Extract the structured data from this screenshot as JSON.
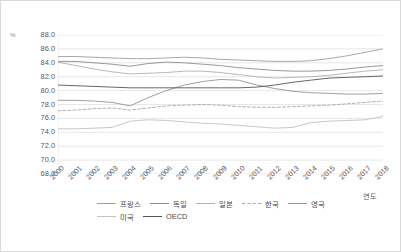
{
  "axes": {
    "y_unit_label": "%",
    "y_ticks": [
      "88.0",
      "86.0",
      "84.0",
      "82.0",
      "80.0",
      "78.0",
      "76.0",
      "74.0",
      "72.0",
      "70.0",
      "68.0"
    ],
    "x_title": "연도",
    "x_ticks": [
      "2000",
      "2001",
      "2002",
      "2003",
      "2004",
      "2005",
      "2006",
      "2007",
      "2008",
      "2009",
      "2010",
      "2011",
      "2012",
      "2013",
      "2014",
      "2015",
      "2016",
      "2017",
      "2018"
    ]
  },
  "legend": {
    "items": [
      {
        "label": "프랑스",
        "color": "#9e9e9e",
        "dash": "solid"
      },
      {
        "label": "독일",
        "color": "#8c8c8c",
        "dash": "solid"
      },
      {
        "label": "일본",
        "color": "#b0b0b0",
        "dash": "solid"
      },
      {
        "label": "한국",
        "color": "#a8a8a8",
        "dash": "dashed"
      },
      {
        "label": "영국",
        "color": "#949494",
        "dash": "solid"
      },
      {
        "label": "미국",
        "color": "#c2c2c2",
        "dash": "solid"
      },
      {
        "label": "OECD",
        "color": "#555555",
        "dash": "solid"
      }
    ]
  },
  "chart_data": {
    "type": "line",
    "title": "",
    "xlabel": "연도",
    "ylabel": "%",
    "ylim": [
      68.0,
      88.0
    ],
    "ytick_step": 2.0,
    "grid": true,
    "legend_position": "bottom",
    "x": [
      2000,
      2001,
      2002,
      2003,
      2004,
      2005,
      2006,
      2007,
      2008,
      2009,
      2010,
      2011,
      2012,
      2013,
      2014,
      2015,
      2016,
      2017,
      2018
    ],
    "series": [
      {
        "name": "프랑스",
        "color": "#9e9e9e",
        "dash": "solid",
        "values": [
          84.9,
          84.9,
          84.8,
          84.7,
          84.6,
          84.6,
          84.7,
          84.8,
          84.7,
          84.5,
          84.4,
          84.3,
          84.2,
          84.2,
          84.3,
          84.6,
          85.0,
          85.5,
          86.0
        ]
      },
      {
        "name": "독일",
        "color": "#8c8c8c",
        "dash": "solid",
        "values": [
          84.2,
          84.2,
          84.0,
          83.8,
          83.5,
          83.9,
          84.1,
          84.0,
          83.8,
          83.6,
          83.3,
          83.1,
          82.9,
          82.8,
          82.8,
          82.9,
          83.1,
          83.4,
          83.6
        ]
      },
      {
        "name": "일본",
        "color": "#b0b0b0",
        "dash": "solid",
        "values": [
          84.1,
          83.6,
          83.1,
          82.7,
          82.4,
          82.5,
          82.6,
          82.8,
          82.8,
          82.6,
          82.3,
          82.0,
          81.8,
          81.9,
          82.0,
          82.2,
          82.5,
          82.8,
          83.0
        ]
      },
      {
        "name": "한국",
        "color": "#a8a8a8",
        "dash": "dashed",
        "values": [
          77.1,
          77.2,
          77.4,
          77.5,
          77.2,
          77.5,
          77.8,
          77.9,
          78.0,
          77.9,
          77.7,
          77.6,
          77.6,
          77.7,
          77.8,
          77.9,
          78.1,
          78.3,
          78.5
        ]
      },
      {
        "name": "영국",
        "color": "#949494",
        "dash": "solid",
        "values": [
          78.6,
          78.6,
          78.5,
          78.3,
          77.8,
          79.0,
          80.0,
          80.8,
          81.3,
          81.6,
          81.5,
          80.8,
          80.3,
          79.9,
          79.7,
          79.6,
          79.5,
          79.5,
          79.6
        ]
      },
      {
        "name": "미국",
        "color": "#c2c2c2",
        "dash": "solid",
        "values": [
          74.5,
          74.5,
          74.6,
          74.7,
          75.6,
          75.8,
          75.7,
          75.5,
          75.3,
          75.2,
          75.0,
          74.8,
          74.6,
          74.7,
          75.4,
          75.6,
          75.7,
          75.8,
          76.3
        ]
      },
      {
        "name": "OECD",
        "color": "#555555",
        "dash": "solid",
        "values": [
          80.8,
          80.7,
          80.6,
          80.5,
          80.4,
          80.4,
          80.4,
          80.4,
          80.4,
          80.4,
          80.4,
          80.5,
          80.8,
          81.2,
          81.5,
          81.8,
          81.9,
          82.0,
          82.1
        ]
      }
    ]
  }
}
